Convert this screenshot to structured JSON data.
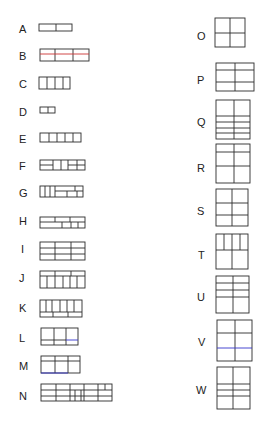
{
  "diagram": {
    "left_column": [
      "A",
      "B",
      "C",
      "D",
      "E",
      "F",
      "G",
      "H",
      "I",
      "J",
      "K",
      "L",
      "M",
      "N"
    ],
    "right_column": [
      "O",
      "P",
      "Q",
      "R",
      "S",
      "T",
      "U",
      "V",
      "W"
    ],
    "accent_colors": {
      "red_line": "#cc3333",
      "blue_line": "#3333cc",
      "stroke": "#2a2a2a"
    }
  },
  "labels": {
    "A": "A",
    "B": "B",
    "C": "C",
    "D": "D",
    "E": "E",
    "F": "F",
    "G": "G",
    "H": "H",
    "I": "I",
    "J": "J",
    "K": "K",
    "L": "L",
    "M": "M",
    "N": "N",
    "O": "O",
    "P": "P",
    "Q": "Q",
    "R": "R",
    "S": "S",
    "T": "T",
    "U": "U",
    "V": "V",
    "W": "W"
  }
}
